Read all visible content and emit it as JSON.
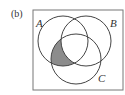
{
  "figure": {
    "panel_label": "(b)",
    "universe": {
      "x": 33,
      "y": 10,
      "width": 90,
      "height": 80,
      "stroke": "#777777"
    },
    "sets": [
      {
        "name": "A",
        "cx": 63,
        "cy": 41,
        "r": 25,
        "label_x": 36,
        "label_y": 27
      },
      {
        "name": "B",
        "cx": 86,
        "cy": 41,
        "r": 25,
        "label_x": 110,
        "label_y": 27
      },
      {
        "name": "C",
        "cx": 76,
        "cy": 59,
        "r": 25,
        "label_x": 98,
        "label_y": 82
      }
    ],
    "shaded_region": "A ∩ C − B",
    "shade_color": "#8c8c8c",
    "stroke_color": "#444444"
  }
}
